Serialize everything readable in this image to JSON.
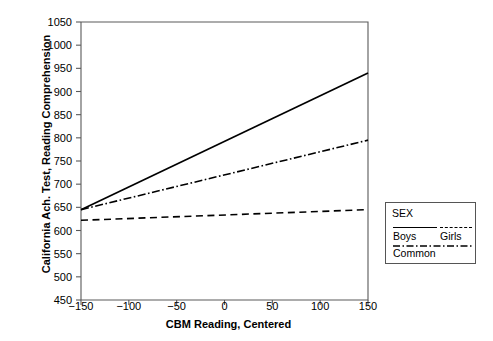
{
  "chart_data": {
    "type": "line",
    "title": "",
    "xlabel": "CBM Reading, Centered",
    "ylabel": "California Ach. Test, Reading Comprehension",
    "xlim": [
      -150,
      150
    ],
    "ylim": [
      450,
      1050
    ],
    "xticks": [
      "-150",
      "-100",
      "-50",
      "0",
      "50",
      "100",
      "150"
    ],
    "xtick_values": [
      -150,
      -100,
      -50,
      0,
      50,
      100,
      150
    ],
    "yticks": [
      "1050",
      "1000",
      "950",
      "900",
      "850",
      "800",
      "750",
      "700",
      "650",
      "600",
      "550",
      "500",
      "450"
    ],
    "ytick_values": [
      1050,
      1000,
      950,
      900,
      850,
      800,
      750,
      700,
      650,
      600,
      550,
      500,
      450
    ],
    "grid": false,
    "legend_position": "right-outside",
    "series": [
      {
        "name": "Boys",
        "style": "solid",
        "color": "#000000",
        "x": [
          -150,
          150
        ],
        "values": [
          645,
          940
        ]
      },
      {
        "name": "Girls",
        "style": "dashed",
        "color": "#000000",
        "x": [
          -150,
          150
        ],
        "values": [
          622,
          645
        ]
      },
      {
        "name": "Common",
        "style": "dash-dot",
        "color": "#000000",
        "x": [
          -150,
          150
        ],
        "values": [
          645,
          795
        ]
      }
    ]
  },
  "legend": {
    "title": "SEX",
    "entries": [
      {
        "label": "Boys",
        "style": "solid"
      },
      {
        "label": "Girls",
        "style": "dashed"
      },
      {
        "label": "Common",
        "style": "dash-dot"
      }
    ]
  }
}
